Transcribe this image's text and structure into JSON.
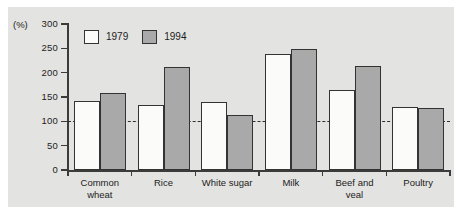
{
  "chart_data": {
    "type": "bar",
    "title": "",
    "subtitle": "",
    "xlabel": "",
    "ylabel": "(%)",
    "ylim": [
      0,
      300
    ],
    "yticks": [
      0,
      50,
      100,
      150,
      200,
      250,
      300
    ],
    "ytick_labels": [
      "0",
      "50",
      "100",
      "150",
      "200",
      "250",
      "300"
    ],
    "grid": false,
    "legend_position": "top-left-inside",
    "reference_line": {
      "value": 100,
      "style": "dashed",
      "label": ""
    },
    "categories": [
      "Common\nwheat",
      "Rice",
      "White sugar",
      "Milk",
      "Beef and\nveal",
      "Poultry"
    ],
    "series": [
      {
        "name": "1979",
        "color": "#fbfbf9",
        "values": [
          142,
          133,
          140,
          238,
          165,
          130
        ]
      },
      {
        "name": "1994",
        "color": "#a9a9a9",
        "values": [
          158,
          212,
          112,
          248,
          213,
          127
        ]
      }
    ]
  },
  "legend": {
    "items": [
      {
        "label": "1979",
        "swatch": "white-square"
      },
      {
        "label": "1994",
        "swatch": "gray-square"
      }
    ]
  },
  "axis": {
    "unit_label": "(%)"
  },
  "colors": {
    "series_1979": "#fbfbf9",
    "series_1994": "#a9a9a9",
    "outline": "#333333",
    "axis": "#3b3b3b",
    "panel_background": "#e3e3e1",
    "page_background": "#ffffff",
    "text": "#1c1c1c"
  }
}
